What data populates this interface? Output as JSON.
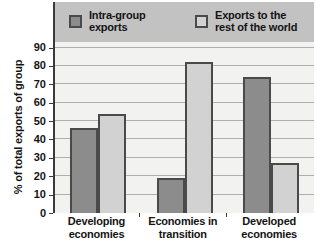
{
  "chart_data": {
    "type": "bar",
    "title": "",
    "ylabel": "% of total exports of group",
    "xlabel": "",
    "categories": [
      "Developing economies",
      "Economies in transition",
      "Developed economies"
    ],
    "series": [
      {
        "name": "Intra-group exports",
        "color": "#8c8c8c",
        "values": [
          46,
          19,
          74
        ]
      },
      {
        "name": "Exports to the rest of the world",
        "color": "#d2d2d2",
        "values": [
          54,
          82,
          27
        ]
      }
    ],
    "yticks": [
      0,
      10,
      20,
      30,
      40,
      50,
      60,
      70,
      80,
      90
    ],
    "ylim": [
      0,
      93
    ],
    "grid": true,
    "legend_position": "top"
  },
  "colors": {
    "legend_band": "#c2c2c2",
    "plot_background": "#f2f2f0",
    "gridline": "#aeaeae",
    "axis": "#3a3a3a",
    "bar_border": "#4a4a4a",
    "text": "#141414"
  }
}
